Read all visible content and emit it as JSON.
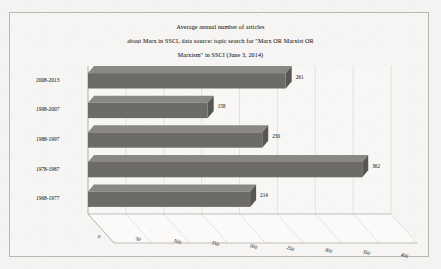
{
  "chart_data": {
    "type": "bar",
    "orientation": "horizontal",
    "title": "Average annual number of articles about Marx in SSCI, data source: topic search for \"Marx OR Marxist OR Marxism\" in SSCI (June 3, 2014)",
    "title_lines": [
      "Average annual number of articles",
      "about Marx in SSCI, data source: topic search for \"Marx OR Marxist OR",
      "Marxism\" in SSCI (June 3, 2014)"
    ],
    "categories": [
      "2008-2013",
      "1998-2007",
      "1988-1997",
      "1978-1987",
      "1968-1977"
    ],
    "values": [
      261,
      158,
      230,
      362,
      214
    ],
    "value_labels": [
      "261",
      "158",
      "230",
      "362",
      "214"
    ],
    "xlabel": "",
    "ylabel": "",
    "xlim": [
      0,
      400
    ],
    "xticks": [
      0,
      50,
      100,
      150,
      200,
      250,
      300,
      350,
      400
    ],
    "xtick_labels": [
      "0",
      "50",
      "100",
      "150",
      "200",
      "250",
      "300",
      "350",
      "400"
    ],
    "grid": true,
    "legend": false,
    "style": "3d-perspective",
    "bar_color": "#6d6b67",
    "plot_background": "#f8f7f5",
    "page_background": "#f4f3f1"
  }
}
